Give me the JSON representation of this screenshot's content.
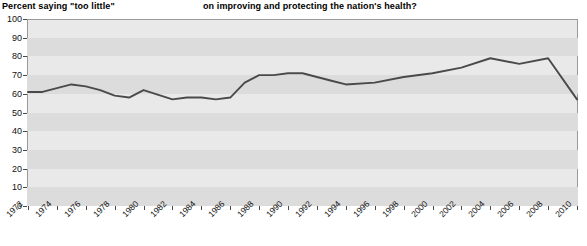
{
  "header": {
    "left_label": "Percent saying \"too little\"",
    "title": "on improving and protecting the nation's health?"
  },
  "chart_data": {
    "type": "line",
    "title": "on improving and protecting the nation's health?",
    "subtitle": "",
    "xlabel": "",
    "ylabel": "Percent saying \"too little\"",
    "ylim": [
      0,
      100
    ],
    "xlim": [
      1972,
      2010
    ],
    "ytick_labels": [
      "0",
      "10",
      "20",
      "30",
      "40",
      "50",
      "60",
      "70",
      "80",
      "90",
      "100"
    ],
    "ytick_values": [
      0,
      10,
      20,
      30,
      40,
      50,
      60,
      70,
      80,
      90,
      100
    ],
    "xtick_labels": [
      "1972",
      "1974",
      "1976",
      "1978",
      "1980",
      "1982",
      "1984",
      "1986",
      "1988",
      "1990",
      "1992",
      "1994",
      "1996",
      "1998",
      "2000",
      "2002",
      "2004",
      "2006",
      "2008",
      "2010"
    ],
    "grid": "horizontal-bands",
    "legend": "none",
    "line_color": "#4a4a4a",
    "plot_background": "#e9e9e9",
    "band_color": "#dcdcdc",
    "x": [
      1972,
      1973,
      1974,
      1975,
      1976,
      1977,
      1978,
      1979,
      1980,
      1982,
      1983,
      1984,
      1985,
      1986,
      1987,
      1988,
      1989,
      1990,
      1991,
      1993,
      1994,
      1996,
      1998,
      2000,
      2002,
      2004,
      2006,
      2008,
      2010
    ],
    "values": [
      61,
      61,
      63,
      65,
      64,
      62,
      59,
      58,
      62,
      57,
      58,
      58,
      57,
      58,
      66,
      70,
      70,
      71,
      71,
      67,
      65,
      66,
      69,
      71,
      74,
      79,
      76,
      79,
      57
    ],
    "series": [
      {
        "name": "Percent saying \"too little\"",
        "values": [
          61,
          61,
          63,
          65,
          64,
          62,
          59,
          58,
          62,
          57,
          58,
          58,
          57,
          58,
          66,
          70,
          70,
          71,
          71,
          67,
          65,
          66,
          69,
          71,
          74,
          79,
          76,
          79,
          57
        ]
      }
    ]
  }
}
